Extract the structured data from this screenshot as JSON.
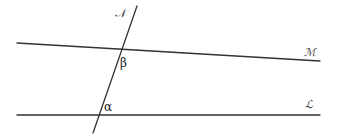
{
  "diagram": {
    "type": "transversal-intersecting-lines",
    "stroke_color": "#333333",
    "background": "#ffffff",
    "lines": [
      {
        "id": "M",
        "label": "ℳ",
        "x1": 17,
        "y1": 43,
        "x2": 320,
        "y2": 61,
        "label_x": 304,
        "label_y": 56
      },
      {
        "id": "L",
        "label": "ℒ",
        "x1": 17,
        "y1": 115,
        "x2": 320,
        "y2": 115,
        "label_x": 305,
        "label_y": 108
      },
      {
        "id": "N",
        "label": "𝒩",
        "x1": 93,
        "y1": 133,
        "x2": 137,
        "y2": 6,
        "label_x": 115,
        "label_y": 17
      }
    ],
    "angles": [
      {
        "id": "beta",
        "label": "β",
        "x": 120,
        "y": 67
      },
      {
        "id": "alpha",
        "label": "α",
        "x": 104,
        "y": 111
      }
    ]
  }
}
